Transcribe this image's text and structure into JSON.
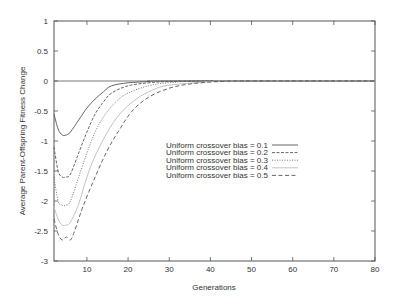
{
  "chart_data": {
    "type": "line",
    "title": "",
    "xlabel": "Generations",
    "ylabel": "Average Parent-Offspring Fitness Change",
    "xlim": [
      2,
      80
    ],
    "ylim": [
      -3,
      1
    ],
    "grid": false,
    "zero_line": true,
    "legend_position": "center-right",
    "x_ticks": [
      10,
      20,
      30,
      40,
      50,
      60,
      70,
      80
    ],
    "x_tick_labels": [
      "10",
      "20",
      "30",
      "40",
      "50",
      "60",
      "70",
      "80"
    ],
    "y_ticks": [
      1,
      0.5,
      0,
      -0.5,
      -1,
      -1.5,
      -2,
      -2.5,
      -3
    ],
    "y_tick_labels": [
      "1",
      "0.5",
      "0",
      "-0.5",
      "-1",
      "-1.5",
      "-2",
      "-2.5",
      "-3"
    ],
    "series": [
      {
        "name": "Uniform crossover bias = 0.1",
        "dash": "",
        "color": "#555555",
        "x": [
          2,
          3,
          4,
          5,
          6,
          8,
          10,
          12,
          14,
          16,
          20,
          25,
          30,
          80
        ],
        "y": [
          -0.55,
          -0.8,
          -0.9,
          -0.9,
          -0.85,
          -0.65,
          -0.45,
          -0.3,
          -0.18,
          -0.08,
          -0.03,
          -0.01,
          0,
          0
        ]
      },
      {
        "name": "Uniform crossover bias = 0.2",
        "dash": "3,1.5",
        "color": "#555555",
        "x": [
          2,
          3,
          4,
          5,
          6,
          8,
          10,
          12,
          14,
          16,
          20,
          25,
          30,
          40,
          80
        ],
        "y": [
          -1.1,
          -1.5,
          -1.6,
          -1.6,
          -1.55,
          -1.2,
          -0.85,
          -0.55,
          -0.35,
          -0.2,
          -0.08,
          -0.03,
          -0.01,
          0,
          0
        ]
      },
      {
        "name": "Uniform crossover bias = 0.3",
        "dash": "1,1.5",
        "color": "#666666",
        "x": [
          2,
          3,
          4,
          5,
          6,
          8,
          10,
          12,
          14,
          17,
          20,
          25,
          30,
          40,
          80
        ],
        "y": [
          -1.6,
          -2.0,
          -2.07,
          -2.07,
          -2.0,
          -1.6,
          -1.2,
          -0.85,
          -0.6,
          -0.35,
          -0.2,
          -0.08,
          -0.03,
          0,
          0
        ]
      },
      {
        "name": "Uniform crossover bias = 0.4",
        "dash": "",
        "color": "#bbbbbb",
        "x": [
          2,
          3,
          4,
          5,
          6,
          8,
          10,
          12,
          15,
          18,
          22,
          26,
          30,
          40,
          45,
          80
        ],
        "y": [
          -2.1,
          -2.3,
          -2.4,
          -2.4,
          -2.35,
          -2.05,
          -1.6,
          -1.25,
          -0.85,
          -0.55,
          -0.3,
          -0.15,
          -0.07,
          -0.01,
          0,
          0
        ]
      },
      {
        "name": "Uniform crossover bias = 0.5",
        "dash": "4,2.5",
        "color": "#555555",
        "x": [
          2,
          3,
          4,
          5,
          6,
          7,
          9,
          12,
          15,
          18,
          21,
          25,
          30,
          35,
          42,
          50,
          80
        ],
        "y": [
          -2.3,
          -2.55,
          -2.65,
          -2.6,
          -2.65,
          -2.5,
          -2.1,
          -1.6,
          -1.15,
          -0.8,
          -0.5,
          -0.27,
          -0.12,
          -0.05,
          -0.01,
          0,
          0
        ]
      }
    ]
  }
}
